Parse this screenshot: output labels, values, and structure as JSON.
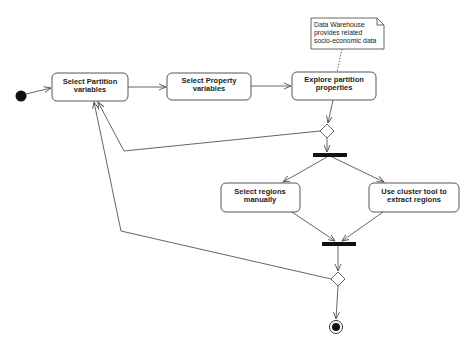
{
  "diagram": {
    "type": "UML activity diagram",
    "colors": {
      "stroke": "#555555",
      "fill": "#ffffff",
      "node": "#111111",
      "text": "#222222"
    },
    "note": {
      "lines": [
        "Data Warehouse",
        "provides related",
        "socio-economic data"
      ]
    },
    "activities": [
      {
        "id": "a1",
        "lines": [
          "Select Partition",
          "variables"
        ]
      },
      {
        "id": "a2",
        "lines": [
          "Select Property",
          "variables"
        ]
      },
      {
        "id": "a3",
        "lines": [
          "Explore partition",
          "properties"
        ]
      },
      {
        "id": "a4",
        "lines": [
          "Select regions",
          "manually"
        ]
      },
      {
        "id": "a5",
        "lines": [
          "Use cluster tool to",
          "extract regions"
        ]
      }
    ],
    "nodes": [
      "initial",
      "decision-1",
      "fork",
      "join",
      "decision-2",
      "final"
    ]
  }
}
